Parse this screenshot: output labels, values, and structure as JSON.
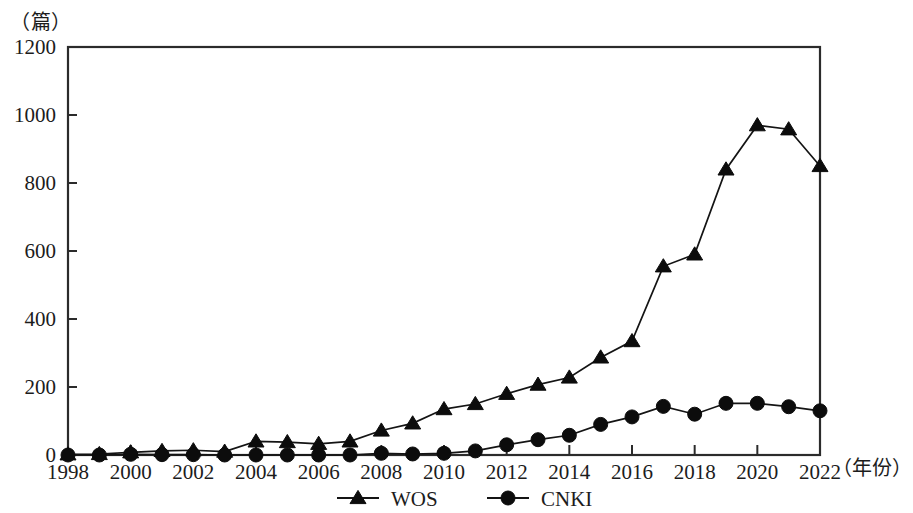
{
  "chart_data": {
    "type": "line",
    "title": "",
    "subtitle": "",
    "xlabel": "（年份）",
    "ylabel": "（篇）",
    "ylim": [
      0,
      1200
    ],
    "xlim": [
      1998,
      2022
    ],
    "y_ticks": [
      0,
      200,
      400,
      600,
      800,
      1000,
      1200
    ],
    "x_ticks": [
      1998,
      2000,
      2002,
      2004,
      2006,
      2008,
      2010,
      2012,
      2014,
      2016,
      2018,
      2020,
      2022
    ],
    "x_tick_labels": [
      "1998",
      "2000",
      "2002",
      "2004",
      "2006",
      "2008",
      "2010",
      "2012",
      "2014",
      "2016",
      "2018",
      "2020",
      "2022"
    ],
    "y_tick_labels": [
      "0",
      "200",
      "400",
      "600",
      "800",
      "1000",
      "1200"
    ],
    "grid": false,
    "legend_position": "bottom-center",
    "x": [
      1998,
      1999,
      2000,
      2001,
      2002,
      2003,
      2004,
      2005,
      2006,
      2007,
      2008,
      2009,
      2010,
      2011,
      2012,
      2013,
      2014,
      2015,
      2016,
      2017,
      2018,
      2019,
      2020,
      2021,
      2022
    ],
    "series": [
      {
        "name": "WOS",
        "marker": "triangle",
        "color": "#0c0c0c",
        "values": [
          2,
          3,
          8,
          12,
          14,
          10,
          40,
          38,
          33,
          40,
          72,
          93,
          135,
          150,
          180,
          207,
          228,
          287,
          335,
          555,
          590,
          840,
          970,
          958,
          850
        ]
      },
      {
        "name": "CNKI",
        "marker": "circle",
        "color": "#0c0c0c",
        "values": [
          0,
          0,
          2,
          1,
          1,
          0,
          0,
          0,
          0,
          0,
          5,
          3,
          5,
          12,
          30,
          45,
          58,
          90,
          112,
          143,
          120,
          152,
          152,
          142,
          130
        ]
      }
    ]
  },
  "legend": {
    "items": [
      {
        "label": "WOS",
        "marker": "triangle"
      },
      {
        "label": "CNKI",
        "marker": "circle"
      }
    ]
  },
  "axes": {
    "y_unit": "（篇）",
    "x_unit": "（年份）"
  }
}
